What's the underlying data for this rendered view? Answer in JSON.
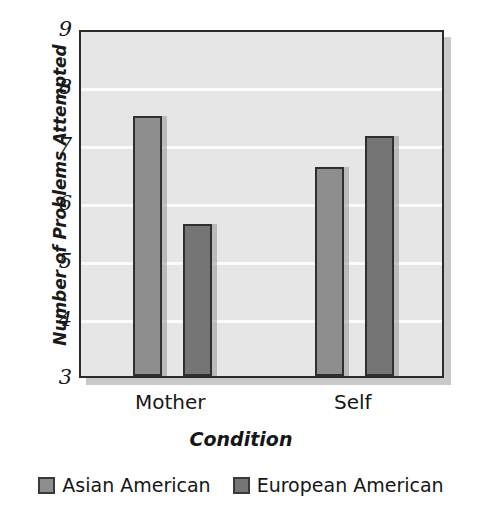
{
  "chart_data": {
    "type": "bar",
    "title": "",
    "xlabel": "Condition",
    "ylabel": "Number of Problems Attempted",
    "categories": [
      "Mother",
      "Self"
    ],
    "series": [
      {
        "name": "Asian American",
        "values": [
          7.48,
          6.6
        ],
        "color": "#8e8e8e"
      },
      {
        "name": "European American",
        "values": [
          5.62,
          7.14
        ],
        "color": "#757575"
      }
    ],
    "ylim": [
      3,
      9
    ],
    "yticks": [
      "3",
      "4",
      "5",
      "6",
      "7",
      "8",
      "9"
    ],
    "grid": true,
    "legend_position": "bottom",
    "plot_background": "#e6e6e6",
    "gridline_color": "#fbfbfb",
    "axis_color": "#2b2b2b"
  },
  "axes": {
    "y_title": "Number of Problems Attempted",
    "x_title": "Condition",
    "y_tick_labels": [
      "9",
      "8",
      "7",
      "6",
      "5",
      "4",
      "3"
    ],
    "x_tick_labels": [
      "Mother",
      "Self"
    ]
  },
  "legend": {
    "entries": [
      {
        "label": "Asian American",
        "swatch": "legend-swatch-asian-american"
      },
      {
        "label": "European American",
        "swatch": "legend-swatch-european-american"
      }
    ]
  }
}
